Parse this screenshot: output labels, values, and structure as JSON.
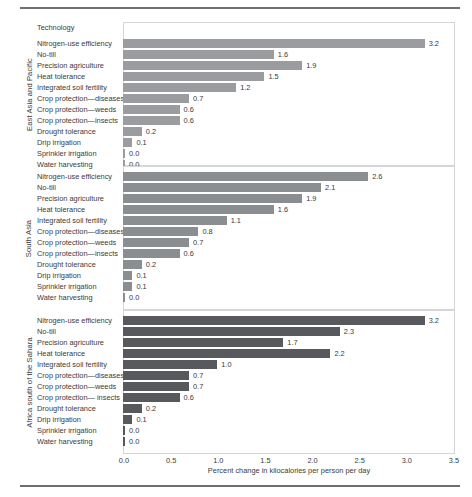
{
  "chart_data": {
    "type": "bar",
    "orientation": "horizontal",
    "title": "",
    "xlabel": "Percent change in kilocalories per person per day",
    "ylabel": "",
    "category_header": "Technology",
    "xlim": [
      0.0,
      3.5
    ],
    "xticks": [
      "0.0",
      "0.5",
      "1.0",
      "1.5",
      "2.0",
      "2.5",
      "3.0",
      "3.5"
    ],
    "xtick_values": [
      0.0,
      0.5,
      1.0,
      1.5,
      2.0,
      2.5,
      3.0,
      3.5
    ],
    "grid": false,
    "legend": "none",
    "panels": [
      {
        "region": "East Asia and Pacific",
        "bar_color": "#9a9c9f",
        "categories": [
          "Nitrogen-use efficiency",
          "No-till",
          "Precision agriculture",
          "Heat tolerance",
          "Integrated soil fertility",
          "Crop protection—diseases",
          "Crop protection—weeds",
          "Crop protection—insects",
          "Drought tolerance",
          "Drip irrigation",
          "Sprinkler irrigation",
          "Water harvesting"
        ],
        "values": [
          3.2,
          1.6,
          1.9,
          1.5,
          1.2,
          0.7,
          0.6,
          0.6,
          0.2,
          0.1,
          0.0,
          0.0
        ],
        "labels": [
          "3.2",
          "1.6",
          "1.9",
          "1.5",
          "1.2",
          "0.7",
          "0.6",
          "0.6",
          "0.2",
          "0.1",
          "0.0",
          "0.0"
        ]
      },
      {
        "region": "South Asia",
        "bar_color": "#8b8e91",
        "categories": [
          "Nitrogen-use efficiency",
          "No-till",
          "Precision agriculture",
          "Heat tolerance",
          "Integrated soil fertility",
          "Crop protection—diseases",
          "Crop protection—weeds",
          "Crop protection—insects",
          "Drought tolerance",
          "Drip irrigation",
          "Sprinkler irrigation",
          "Water harvesting"
        ],
        "values": [
          2.6,
          2.1,
          1.9,
          1.6,
          1.1,
          0.8,
          0.7,
          0.6,
          0.2,
          0.1,
          0.1,
          0.0
        ],
        "labels": [
          "2.6",
          "2.1",
          "1.9",
          "1.6",
          "1.1",
          "0.8",
          "0.7",
          "0.6",
          "0.2",
          "0.1",
          "0.1",
          "0.0"
        ]
      },
      {
        "region": "Africa south of the Sahara",
        "bar_color": "#57595c",
        "categories": [
          "Nitrogen-use efficiency",
          "No-till",
          "Precision agriculture",
          "Heat tolerance",
          "Integrated soil fertility",
          "Crop protection—diseases",
          "Crop protection—weeds",
          "Crop protection— insects",
          "Drought tolerance",
          "Drip irrigation",
          "Sprinkler irrigation",
          "Water harvesting"
        ],
        "values": [
          3.2,
          2.3,
          1.7,
          2.2,
          1.0,
          0.7,
          0.7,
          0.6,
          0.2,
          0.1,
          0.0,
          0.0
        ],
        "labels": [
          "3.2",
          "2.3",
          "1.7",
          "2.2",
          "1.0",
          "0.7",
          "0.7",
          "0.6",
          "0.2",
          "0.1",
          "0.0",
          "0.0"
        ]
      }
    ]
  }
}
